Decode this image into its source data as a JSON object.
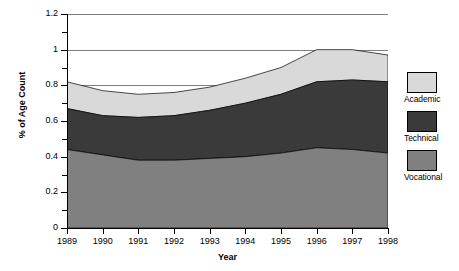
{
  "chart_data": {
    "type": "area",
    "stacked": true,
    "title": "",
    "xlabel": "Year",
    "ylabel": "% of Age Count",
    "x": [
      1989,
      1990,
      1991,
      1992,
      1993,
      1994,
      1995,
      1996,
      1997,
      1998
    ],
    "xtick_labels": [
      "1989",
      "1990",
      "1991",
      "1992",
      "1993",
      "1994",
      "1995",
      "1996",
      "1997",
      "1998"
    ],
    "ylim": [
      0,
      1.2
    ],
    "ytick_labels": [
      "0",
      "0.2",
      "0.4",
      "0.6",
      "0.8",
      "1",
      "1.2"
    ],
    "ytick_values": [
      0,
      0.2,
      0.4,
      0.6,
      0.8,
      1.0,
      1.2
    ],
    "yminor_values": [
      0.1,
      0.3,
      0.5,
      0.7,
      0.9,
      1.1
    ],
    "grid": true,
    "grid_axis": "y",
    "legend_position": "right",
    "series": [
      {
        "name": "Vocational",
        "color": "#808080",
        "values": [
          0.44,
          0.41,
          0.38,
          0.38,
          0.39,
          0.4,
          0.42,
          0.45,
          0.44,
          0.42
        ]
      },
      {
        "name": "Technical",
        "color": "#3a3a3a",
        "values": [
          0.23,
          0.22,
          0.24,
          0.25,
          0.27,
          0.3,
          0.33,
          0.37,
          0.39,
          0.4
        ]
      },
      {
        "name": "Academic",
        "color": "#d9d9d9",
        "values": [
          0.15,
          0.14,
          0.13,
          0.13,
          0.13,
          0.14,
          0.15,
          0.18,
          0.17,
          0.15
        ]
      }
    ],
    "stack_tops": {
      "vocational": [
        0.44,
        0.41,
        0.38,
        0.38,
        0.39,
        0.4,
        0.42,
        0.45,
        0.44,
        0.42
      ],
      "technical": [
        0.67,
        0.63,
        0.62,
        0.63,
        0.66,
        0.7,
        0.75,
        0.82,
        0.83,
        0.82
      ],
      "academic": [
        0.82,
        0.77,
        0.75,
        0.76,
        0.79,
        0.84,
        0.9,
        1.0,
        1.0,
        0.97
      ]
    }
  },
  "legend": {
    "entries": [
      {
        "label": "Academic",
        "color": "#d9d9d9"
      },
      {
        "label": "Technical",
        "color": "#3a3a3a"
      },
      {
        "label": "Vocational",
        "color": "#808080"
      }
    ]
  },
  "colors": {
    "academic": "#d9d9d9",
    "technical": "#3a3a3a",
    "vocational": "#808080",
    "gridline": "#808080",
    "axis": "#000000",
    "background": "#ffffff"
  }
}
